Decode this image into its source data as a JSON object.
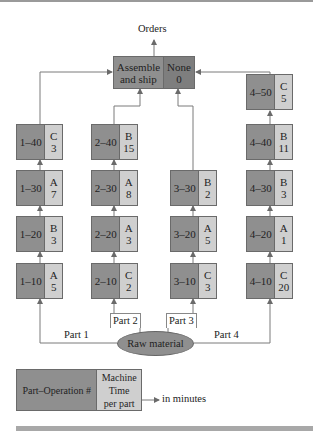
{
  "title": "Orders",
  "assemble": {
    "label_line1": "Assemble",
    "label_line2": "and ship",
    "machine": "None",
    "time": "0"
  },
  "source": {
    "label": "Raw material"
  },
  "parts": [
    {
      "label": "Part 1",
      "operations": [
        {
          "id": "1–10",
          "machine": "A",
          "time": "5"
        },
        {
          "id": "1–20",
          "machine": "B",
          "time": "3"
        },
        {
          "id": "1–30",
          "machine": "A",
          "time": "7"
        },
        {
          "id": "1–40",
          "machine": "C",
          "time": "3"
        }
      ]
    },
    {
      "label": "Part 2",
      "operations": [
        {
          "id": "2–10",
          "machine": "C",
          "time": "2"
        },
        {
          "id": "2–20",
          "machine": "A",
          "time": "3"
        },
        {
          "id": "2–30",
          "machine": "A",
          "time": "8"
        },
        {
          "id": "2–40",
          "machine": "B",
          "time": "15"
        }
      ]
    },
    {
      "label": "Part 3",
      "operations": [
        {
          "id": "3–10",
          "machine": "C",
          "time": "3"
        },
        {
          "id": "3–20",
          "machine": "A",
          "time": "5"
        },
        {
          "id": "3–30",
          "machine": "B",
          "time": "2"
        }
      ]
    },
    {
      "label": "Part 4",
      "operations": [
        {
          "id": "4–10",
          "machine": "C",
          "time": "20"
        },
        {
          "id": "4–20",
          "machine": "A",
          "time": "1"
        },
        {
          "id": "4–30",
          "machine": "B",
          "time": "3"
        },
        {
          "id": "4–40",
          "machine": "B",
          "time": "11"
        },
        {
          "id": "4–50",
          "machine": "C",
          "time": "5"
        }
      ]
    }
  ],
  "legend": {
    "left": "Part–Operation #",
    "right_line1": "Machine",
    "right_line2": "Time",
    "right_line3": "per part",
    "note": "in minutes"
  },
  "colors": {
    "dark": "#8f8f8f",
    "light": "#cfcfcf",
    "assemble_right": "#7e7e7e",
    "line": "#7a7a7a"
  }
}
